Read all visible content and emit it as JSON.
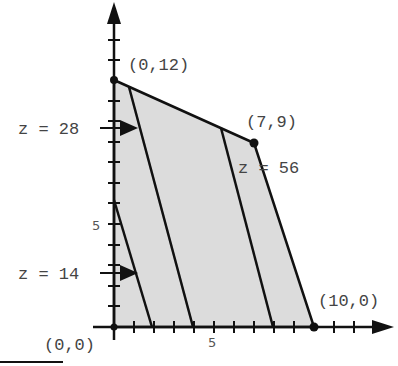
{
  "diagram": {
    "vertices": [
      {
        "label": "(0,12)",
        "x": 0,
        "y": 12
      },
      {
        "label": "(7,9)",
        "x": 7,
        "y": 9
      },
      {
        "label": "(10,0)",
        "x": 10,
        "y": 0
      },
      {
        "label": "(0,0)",
        "x": 0,
        "y": 0
      }
    ],
    "level_lines": [
      {
        "label": "z = 14",
        "value": 14
      },
      {
        "label": "z = 28",
        "value": 28
      },
      {
        "label": "z = 56",
        "value": 56
      }
    ],
    "x_axis": {
      "tick_label": "5"
    },
    "y_axis": {
      "tick_label": "5"
    },
    "colors": {
      "region": "#dcdcdc",
      "stroke": "#111111",
      "text": "#444444"
    }
  }
}
